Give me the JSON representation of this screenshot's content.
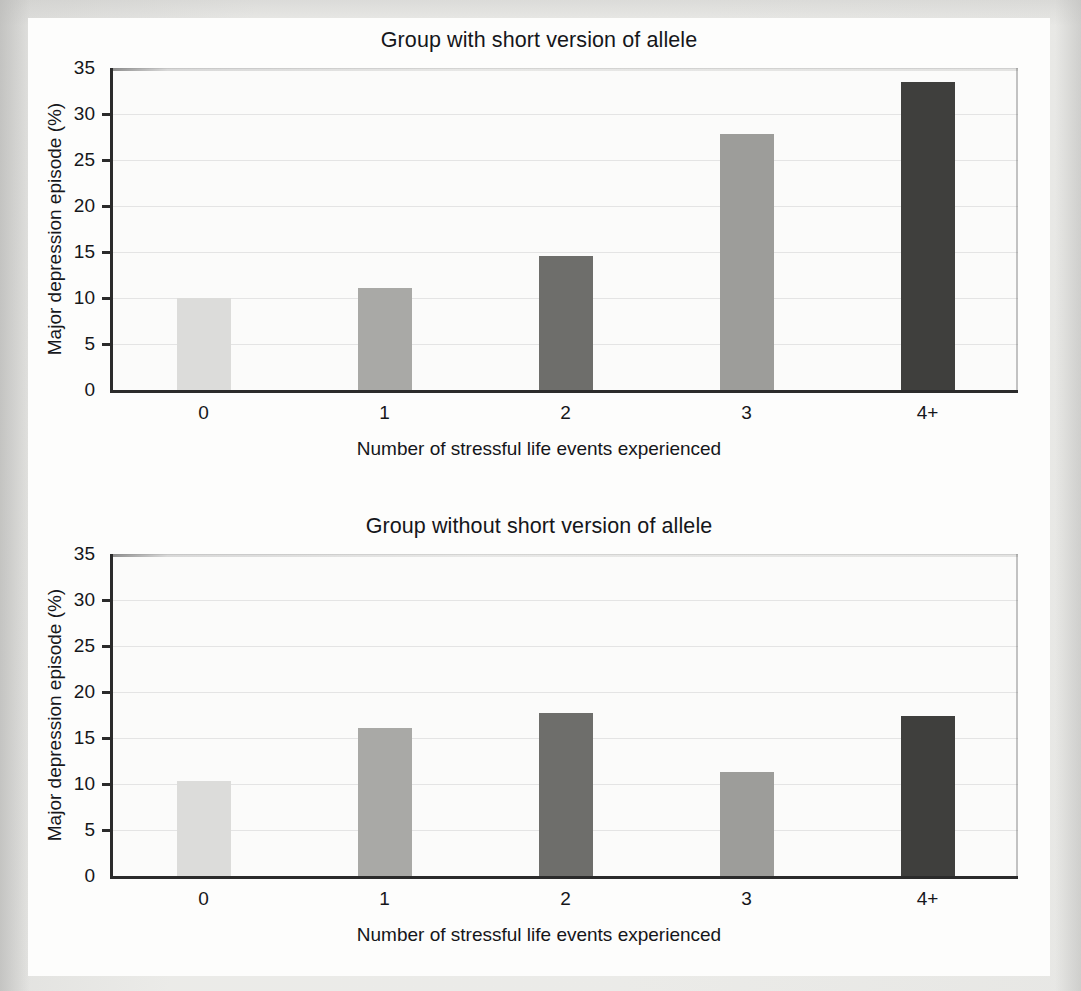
{
  "figure": {
    "y_axis_title": "Major depression episode (%)",
    "x_axis_title": "Number of stressful life events experienced",
    "y_ticks": [
      "0",
      "5",
      "10",
      "15",
      "20",
      "25",
      "30",
      "35"
    ]
  },
  "panels": [
    {
      "title": "Group with short version of allele"
    },
    {
      "title": "Group without short version of allele"
    }
  ],
  "chart_data": [
    {
      "type": "bar",
      "title": "Group with short version of allele",
      "xlabel": "Number of stressful life events experienced",
      "ylabel": "Major depression episode (%)",
      "categories": [
        "0",
        "1",
        "2",
        "3",
        "4+"
      ],
      "values": [
        10.0,
        11.1,
        14.6,
        27.8,
        33.5
      ],
      "bar_colors": [
        "#dcdcda",
        "#a9a9a6",
        "#6e6e6b",
        "#9d9d9a",
        "#3f3f3d"
      ],
      "ylim": [
        0,
        35
      ],
      "yticks": [
        0,
        5,
        10,
        15,
        20,
        25,
        30,
        35
      ],
      "grid": true,
      "legend": "none"
    },
    {
      "type": "bar",
      "title": "Group without short version of allele",
      "xlabel": "Number of stressful life events experienced",
      "ylabel": "Major depression episode (%)",
      "categories": [
        "0",
        "1",
        "2",
        "3",
        "4+"
      ],
      "values": [
        10.3,
        16.1,
        17.7,
        11.3,
        17.4
      ],
      "bar_colors": [
        "#dcdcda",
        "#a9a9a6",
        "#6e6e6b",
        "#9d9d9a",
        "#3f3f3d"
      ],
      "ylim": [
        0,
        35
      ],
      "yticks": [
        0,
        5,
        10,
        15,
        20,
        25,
        30,
        35
      ],
      "grid": true,
      "legend": "none"
    }
  ]
}
